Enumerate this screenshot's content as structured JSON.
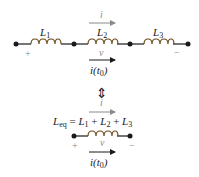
{
  "diagram": {
    "top_circuit": {
      "inductors": [
        {
          "name": "L",
          "sub": "1"
        },
        {
          "name": "L",
          "sub": "2"
        },
        {
          "name": "L",
          "sub": "3"
        }
      ],
      "current_label": "i",
      "voltage_label": "v",
      "plus": "+",
      "minus": "−",
      "initial_current": {
        "main": "i(t",
        "sub": "0",
        "close": ")"
      }
    },
    "equivalence_symbol": "⇕",
    "bottom_circuit": {
      "equation": {
        "lhs": "L",
        "lhs_sub": "eq",
        "eq": " = ",
        "terms": [
          {
            "name": "L",
            "sub": "1"
          },
          {
            "name": "L",
            "sub": "2"
          },
          {
            "name": "L",
            "sub": "3"
          }
        ],
        "plus": " + "
      },
      "current_label": "i",
      "voltage_label": "v",
      "plus": "+",
      "minus": "−",
      "initial_current": {
        "main": "i(t",
        "sub": "0",
        "close": ")"
      }
    },
    "colors": {
      "wire": "#1a1a1a",
      "coil": "#6b4a1e",
      "muted": "#8a8a8a"
    }
  }
}
